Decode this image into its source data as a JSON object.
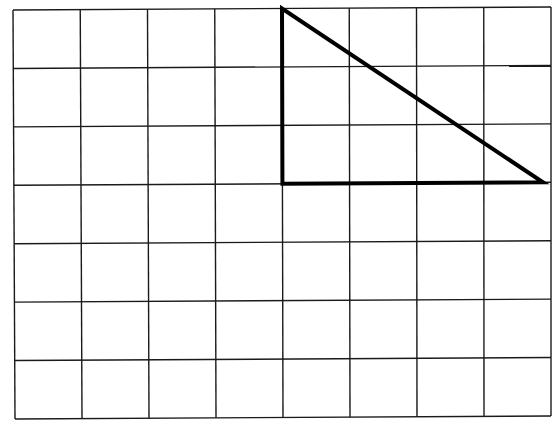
{
  "diagram": {
    "type": "grid-with-triangle",
    "grid": {
      "columns": 8,
      "rows": 7,
      "line_color": "#1a1a1a",
      "background": "#ffffff"
    },
    "triangle": {
      "shape": "right-triangle",
      "vertices_grid": [
        [
          4,
          0
        ],
        [
          4,
          3
        ],
        [
          8,
          3
        ]
      ],
      "stroke_color": "#000000",
      "fill": "none"
    }
  }
}
